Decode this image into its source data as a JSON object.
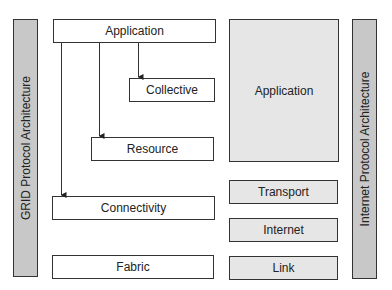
{
  "grid": {
    "title": "GRID Protocol Architecture",
    "layers": {
      "application": "Application",
      "collective": "Collective",
      "resource": "Resource",
      "connectivity": "Connectivity",
      "fabric": "Fabric"
    }
  },
  "internet": {
    "title": "Internet Protocol Architecture",
    "layers": {
      "application": "Application",
      "transport": "Transport",
      "internet": "Internet",
      "link": "Link"
    }
  },
  "colors": {
    "bar_fill": "#c8c8c8",
    "internet_layer_fill": "#e6e6e6",
    "grid_layer_fill": "#ffffff",
    "stroke": "#333333"
  }
}
